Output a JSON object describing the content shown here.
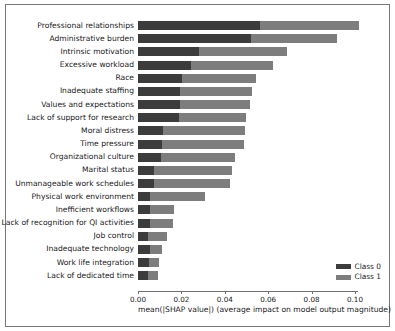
{
  "chart_data": {
    "type": "bar",
    "orientation": "horizontal",
    "stacked": true,
    "title": "",
    "xlabel": "mean(|SHAP value|) (average impact on model output magnitude)",
    "ylabel": "",
    "xlim": [
      0,
      0.108
    ],
    "xticks": [
      0.0,
      0.02,
      0.04,
      0.06,
      0.08,
      0.1
    ],
    "xtick_labels": [
      "0.00",
      "0.02",
      "0.04",
      "0.06",
      "0.08",
      "0.10"
    ],
    "grid": false,
    "legend_position": "lower right",
    "categories": [
      "Professional relationships",
      "Administrative burden",
      "Intrinsic motivation",
      "Excessive workload",
      "Race",
      "Inadequate staffing",
      "Values and expectations",
      "Lack of support for research",
      "Moral distress",
      "Time pressure",
      "Organizational culture",
      "Marital status",
      "Unmanageable work schedules",
      "Physical work environment",
      "Inefficient workflows",
      "Lack of recognition for QI activities",
      "Job control",
      "Inadequate technology",
      "Work life integration",
      "Lack of dedicated time"
    ],
    "series": [
      {
        "name": "Class 0",
        "color": "#3c3c3c",
        "values": [
          0.056,
          0.0519,
          0.0281,
          0.0245,
          0.0201,
          0.0195,
          0.0192,
          0.019,
          0.0114,
          0.0112,
          0.0105,
          0.0074,
          0.0073,
          0.0055,
          0.0055,
          0.0053,
          0.0044,
          0.0057,
          0.005,
          0.0045
        ]
      },
      {
        "name": "Class 1",
        "color": "#7d7d7d",
        "values": [
          0.046,
          0.0396,
          0.0406,
          0.0376,
          0.0344,
          0.033,
          0.0323,
          0.0306,
          0.038,
          0.0375,
          0.034,
          0.0357,
          0.0353,
          0.0254,
          0.011,
          0.011,
          0.0088,
          0.0055,
          0.0045,
          0.0045
        ]
      }
    ],
    "totals": [
      0.102,
      0.0915,
      0.0687,
      0.0621,
      0.0545,
      0.0525,
      0.0515,
      0.0496,
      0.0494,
      0.0487,
      0.0445,
      0.0431,
      0.0426,
      0.0309,
      0.0165,
      0.0163,
      0.0132,
      0.0112,
      0.0095,
      0.009
    ]
  },
  "legend": {
    "items": [
      {
        "label": "Class 0",
        "color": "#3c3c3c"
      },
      {
        "label": "Class 1",
        "color": "#7d7d7d"
      }
    ]
  }
}
